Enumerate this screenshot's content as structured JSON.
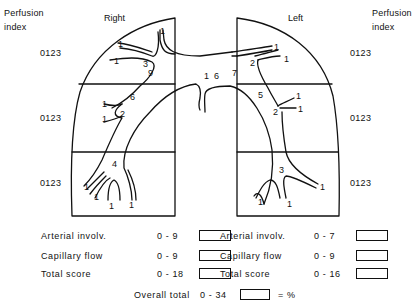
{
  "header": {
    "left_axis_label": [
      "Perfusion",
      "index"
    ],
    "right_axis_label": [
      "Perfusion",
      "index"
    ],
    "right_lung_title": "Right",
    "left_lung_title": "Left"
  },
  "perfusion_index": {
    "zones": [
      "upper",
      "middle",
      "lower"
    ],
    "scale": "0123",
    "left_column": [
      "0123",
      "0123",
      "0123"
    ],
    "right_column": [
      "0123",
      "0123",
      "0123"
    ]
  },
  "right_lung": {
    "segment_labels": {
      "main": "9",
      "upper_trunk": "3",
      "middle_trunk": "6",
      "middle_branch": "2",
      "lower_trunk": "4",
      "hilum": "1",
      "terminal": "1"
    }
  },
  "left_lung": {
    "segment_labels": {
      "main": "7",
      "upper_branch": "2",
      "lingula_trunk": "5",
      "lingula_branch": "2",
      "lower_trunk": "3",
      "hilum": "6",
      "terminal": "1"
    }
  },
  "scores": {
    "right": [
      {
        "name": "Arterial involv.",
        "range": "0 - 9"
      },
      {
        "name": "Capillary flow",
        "range": "0 - 9"
      },
      {
        "name": "Total score",
        "range": "0 - 18"
      }
    ],
    "left": [
      {
        "name": "Arterial involv.",
        "range": "0 - 7"
      },
      {
        "name": "Capillary flow",
        "range": "0 - 9"
      },
      {
        "name": "Total score",
        "range": "0 - 16"
      }
    ],
    "overall": {
      "name": "Overall total",
      "range": "0 - 34",
      "suffix": "= %"
    }
  },
  "colors": {
    "ink": "#111111",
    "paper": "#ffffff"
  }
}
